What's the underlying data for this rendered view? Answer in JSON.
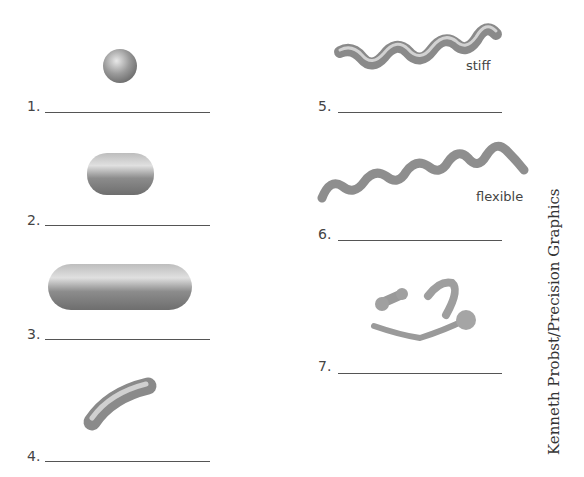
{
  "items": [
    {
      "number": "1.",
      "shape": "sphere"
    },
    {
      "number": "2.",
      "shape": "short-rod"
    },
    {
      "number": "3.",
      "shape": "long-rod"
    },
    {
      "number": "4.",
      "shape": "curved-rod"
    },
    {
      "number": "5.",
      "shape": "stiff-spiral",
      "annotation": "stiff"
    },
    {
      "number": "6.",
      "shape": "flexible-spiral",
      "annotation": "flexible"
    },
    {
      "number": "7.",
      "shape": "fragments"
    }
  ],
  "credit": "Kenneth Probst/Precision Graphics"
}
